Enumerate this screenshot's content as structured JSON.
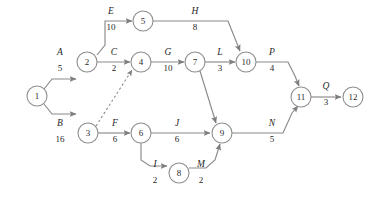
{
  "diagram": {
    "type": "activity-on-arrow-network",
    "title": "",
    "colors": {
      "stroke": "#8a8a8a",
      "node_stroke": "#8e8e8e",
      "node_fill": "#ffffff",
      "text": "#1f1f1f",
      "background": "#ffffff"
    },
    "nodes": [
      {
        "id": "1",
        "label": "1",
        "x": 37,
        "y": 96,
        "r": 10
      },
      {
        "id": "2",
        "label": "2",
        "x": 87,
        "y": 62,
        "r": 10
      },
      {
        "id": "3",
        "label": "3",
        "x": 88,
        "y": 133,
        "r": 10
      },
      {
        "id": "4",
        "label": "4",
        "x": 141,
        "y": 62,
        "r": 10
      },
      {
        "id": "5",
        "label": "5",
        "x": 143,
        "y": 21,
        "r": 10
      },
      {
        "id": "6",
        "label": "6",
        "x": 141,
        "y": 133,
        "r": 10
      },
      {
        "id": "7",
        "label": "7",
        "x": 195,
        "y": 62,
        "r": 10
      },
      {
        "id": "8",
        "label": "8",
        "x": 179,
        "y": 173,
        "r": 10
      },
      {
        "id": "9",
        "label": "9",
        "x": 222,
        "y": 133,
        "r": 10
      },
      {
        "id": "10",
        "label": "10",
        "x": 246,
        "y": 62,
        "r": 10
      },
      {
        "id": "11",
        "label": "11",
        "x": 301,
        "y": 97,
        "r": 10
      },
      {
        "id": "12",
        "label": "12",
        "x": 353,
        "y": 97,
        "r": 10
      }
    ],
    "edges": [
      {
        "id": "A",
        "name": "A",
        "duration": "5",
        "from": "1",
        "to": "2",
        "dashed": false,
        "label_x": 60,
        "label_y": 55,
        "dur_x": 60,
        "dur_y": 71
      },
      {
        "id": "B",
        "name": "B",
        "duration": "16",
        "from": "1",
        "to": "3",
        "dashed": false,
        "label_x": 60,
        "label_y": 126,
        "dur_x": 60,
        "dur_y": 142
      },
      {
        "id": "C",
        "name": "C",
        "duration": "2",
        "from": "2",
        "to": "4",
        "dashed": false,
        "label_x": 114,
        "label_y": 55,
        "dur_x": 114,
        "dur_y": 71
      },
      {
        "id": "E",
        "name": "E",
        "duration": "10",
        "from": "2",
        "to": "5",
        "dashed": false,
        "label_x": 111,
        "label_y": 14,
        "dur_x": 111,
        "dur_y": 30
      },
      {
        "id": "F",
        "name": "F",
        "duration": "6",
        "from": "3",
        "to": "6",
        "dashed": false,
        "label_x": 115,
        "label_y": 126,
        "dur_x": 115,
        "dur_y": 142
      },
      {
        "id": "DUMMY",
        "name": "",
        "duration": "",
        "from": "3",
        "to": "4",
        "dashed": true,
        "label_x": 0,
        "label_y": 0,
        "dur_x": 0,
        "dur_y": 0
      },
      {
        "id": "G",
        "name": "G",
        "duration": "10",
        "from": "4",
        "to": "7",
        "dashed": false,
        "label_x": 168,
        "label_y": 55,
        "dur_x": 168,
        "dur_y": 71
      },
      {
        "id": "H",
        "name": "H",
        "duration": "8",
        "from": "5",
        "to": "10",
        "dashed": false,
        "label_x": 195,
        "label_y": 14,
        "dur_x": 195,
        "dur_y": 30
      },
      {
        "id": "I",
        "name": "I",
        "duration": "2",
        "from": "6",
        "to": "8",
        "dashed": false,
        "label_x": 155,
        "label_y": 167,
        "dur_x": 155,
        "dur_y": 183
      },
      {
        "id": "J",
        "name": "J",
        "duration": "6",
        "from": "6",
        "to": "9",
        "dashed": false,
        "label_x": 177,
        "label_y": 126,
        "dur_x": 177,
        "dur_y": 142
      },
      {
        "id": "L",
        "name": "L",
        "duration": "3",
        "from": "7",
        "to": "10",
        "dashed": false,
        "label_x": 220,
        "label_y": 55,
        "dur_x": 220,
        "dur_y": 71
      },
      {
        "id": "K",
        "name": "",
        "duration": "",
        "from": "7",
        "to": "9",
        "dashed": false,
        "label_x": 0,
        "label_y": 0,
        "dur_x": 0,
        "dur_y": 0
      },
      {
        "id": "M",
        "name": "M",
        "duration": "2",
        "from": "8",
        "to": "9",
        "dashed": false,
        "label_x": 201,
        "label_y": 167,
        "dur_x": 201,
        "dur_y": 183
      },
      {
        "id": "N",
        "name": "N",
        "duration": "5",
        "from": "9",
        "to": "11",
        "dashed": false,
        "label_x": 272,
        "label_y": 126,
        "dur_x": 272,
        "dur_y": 142
      },
      {
        "id": "P",
        "name": "P",
        "duration": "4",
        "from": "10",
        "to": "11",
        "dashed": false,
        "label_x": 272,
        "label_y": 55,
        "dur_x": 272,
        "dur_y": 71
      },
      {
        "id": "Q",
        "name": "Q",
        "duration": "3",
        "from": "11",
        "to": "12",
        "dashed": false,
        "label_x": 326,
        "label_y": 89,
        "dur_x": 326,
        "dur_y": 105
      }
    ],
    "paths": {
      "A": "M 44 89 L 52 79 L 76 79",
      "B": "M 44 104 L 52 114 L 76 114",
      "C": "M 97 62 L 130 62",
      "E": "M 97 55 L 105 45 L 105 21 L 132 21",
      "F": "M 98 133 L 130 133",
      "DUMMY": "M 96 126 L 132 70",
      "G": "M 151 62 L 184 62",
      "H": "M 153 21 L 228 21 L 240 51",
      "I": "M 141 143 L 141 160 L 150 166 L 167 166",
      "J": "M 151 133 L 210 133",
      "L": "M 205 62 L 235 62",
      "K": "M 200 71 L 216 123",
      "M": "M 189 168 L 206 168 L 215 160 L 220 144",
      "N": "M 232 133 L 283 133 L 292 113 L 298 106",
      "P": "M 256 62 L 288 62 L 295 76 L 299 86",
      "Q": "M 311 97 L 341 97"
    }
  }
}
